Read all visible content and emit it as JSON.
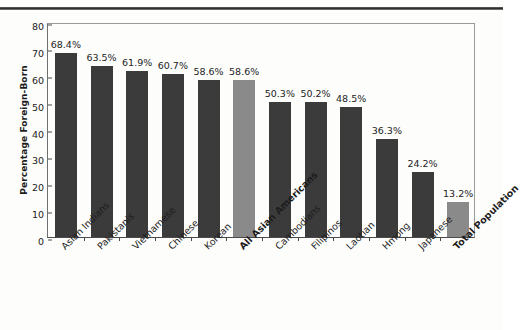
{
  "figure": {
    "top_rule": "page-edge-rule"
  },
  "chart_data": {
    "type": "bar",
    "title": "",
    "subtitle": "",
    "xlabel": "",
    "ylabel": "Percentage Foreign-Born",
    "ylim": [
      0,
      80
    ],
    "yticks": [
      0,
      10,
      20,
      30,
      40,
      50,
      60,
      70,
      80
    ],
    "ytick_labels": [
      "0",
      "10",
      "20",
      "30",
      "40",
      "50",
      "60",
      "70",
      "80"
    ],
    "grid": false,
    "legend": null,
    "categories": [
      "Asian Indians",
      "Pakistanis",
      "Vietnamese",
      "Chinese",
      "Korean",
      "All Asian Americans",
      "Cambodians",
      "Filipinos",
      "Laotian",
      "Hmong",
      "Japanese",
      "Total Population"
    ],
    "values": [
      68.4,
      63.5,
      61.9,
      60.7,
      58.6,
      58.6,
      50.3,
      50.2,
      48.5,
      36.3,
      24.2,
      13.2
    ],
    "value_labels": [
      "68.4%",
      "63.5%",
      "61.9%",
      "60.7%",
      "58.6%",
      "58.6%",
      "50.3%",
      "50.2%",
      "48.5%",
      "36.3%",
      "24.2%",
      "13.2%"
    ],
    "bar_styles": [
      "dark",
      "dark",
      "dark",
      "dark",
      "dark",
      "light",
      "dark",
      "dark",
      "dark",
      "dark",
      "dark",
      "light"
    ],
    "emphasized_categories": [
      "All Asian Americans",
      "Total Population"
    ],
    "colors": {
      "bar_dark": "#3b3b3b",
      "bar_light": "#8a8a8a",
      "axis": "#4a4a4a",
      "frame": "#9a9a9a",
      "text": "#1d1d1d",
      "background": "#fdfdfc"
    }
  }
}
